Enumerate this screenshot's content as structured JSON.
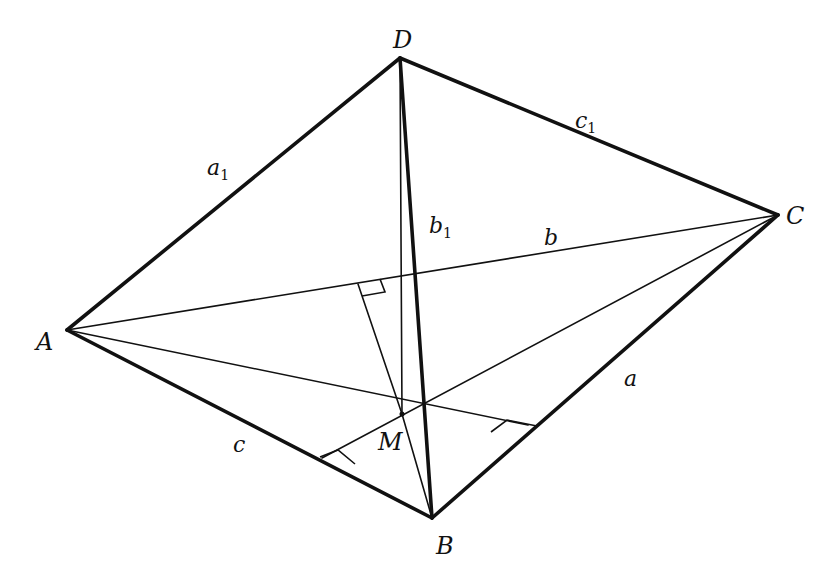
{
  "diagram": {
    "type": "tetrahedron",
    "vertices": {
      "A": {
        "label": "A",
        "x": 67,
        "y": 330,
        "lx": 36,
        "ly": 350
      },
      "B": {
        "label": "B",
        "x": 432,
        "y": 518,
        "lx": 436,
        "ly": 554
      },
      "C": {
        "label": "C",
        "x": 778,
        "y": 215,
        "lx": 786,
        "ly": 224
      },
      "D": {
        "label": "D",
        "x": 400,
        "y": 58,
        "lx": 393,
        "ly": 48
      },
      "M": {
        "label": "M",
        "x": 402,
        "y": 414,
        "lx": 378,
        "ly": 450
      }
    },
    "edges": [
      {
        "name": "a",
        "from": "B",
        "to": "C",
        "label": "a",
        "lx": 624,
        "ly": 386
      },
      {
        "name": "b",
        "from": "A",
        "to": "C",
        "label": "b",
        "lx": 544,
        "ly": 245
      },
      {
        "name": "c",
        "from": "A",
        "to": "B",
        "label": "c",
        "lx": 233,
        "ly": 452
      },
      {
        "name": "a1",
        "from": "A",
        "to": "D",
        "label": "a",
        "sub": "1",
        "lx": 207,
        "ly": 175
      },
      {
        "name": "b1",
        "from": "D",
        "to": "B",
        "label": "b",
        "sub": "1",
        "lx": 429,
        "ly": 233
      },
      {
        "name": "c1",
        "from": "D",
        "to": "C",
        "label": "c",
        "sub": "1",
        "lx": 575,
        "ly": 128
      }
    ],
    "feet": {
      "on_AC": {
        "x": 358,
        "y": 284
      },
      "on_BC": {
        "x": 528,
        "y": 425
      },
      "on_AB": {
        "x": 322,
        "y": 458
      }
    }
  }
}
